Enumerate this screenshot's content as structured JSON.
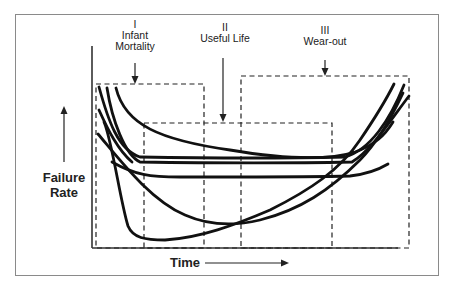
{
  "diagram": {
    "y_axis_label_line1": "Failure",
    "y_axis_label_line2": "Rate",
    "x_axis_label": "Time",
    "regions": [
      {
        "numeral": "I",
        "name_line1": "Infant",
        "name_line2": "Mortality"
      },
      {
        "numeral": "II",
        "name_line1": "Useful Life",
        "name_line2": ""
      },
      {
        "numeral": "III",
        "name_line1": "Wear-out",
        "name_line2": ""
      }
    ],
    "colors": {
      "curve": "#111111",
      "frame": "#8a8a8a",
      "dashed_box": "#222222",
      "text": "#222222"
    }
  }
}
